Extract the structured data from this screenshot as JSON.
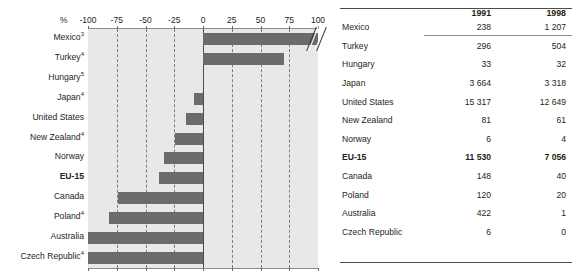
{
  "chart_data": {
    "type": "bar",
    "orientation": "horizontal",
    "title": "",
    "subtitle": "",
    "xlabel": "%",
    "ylabel": "",
    "xlim": [
      -100,
      100
    ],
    "xticks": [
      -100,
      -75,
      -50,
      -25,
      0,
      25,
      50,
      75,
      100
    ],
    "xtick_labels": [
      "-100",
      "-75",
      "-50",
      "-25",
      "0",
      "25",
      "50",
      "75",
      "100"
    ],
    "grid": true,
    "grid_style": "dashed-vertical",
    "legend": "none",
    "axis_break": {
      "present": true,
      "category": "Mexico",
      "note": "double-slash break near the 100% end of the Mexico bar"
    },
    "categories": [
      "Mexico³",
      "Turkey⁴",
      "Hungary⁵",
      "Japan⁴",
      "United States",
      "New Zealand⁴",
      "Norway",
      "EU-15",
      "Canada",
      "Poland⁴",
      "Australia",
      "Czech Republic⁴"
    ],
    "values": [
      100,
      70,
      0,
      -8,
      -15,
      -24,
      -34,
      -38,
      -74,
      -82,
      -100,
      -100
    ],
    "series": [
      {
        "name": "Percentage change 1991-1998",
        "values": [
          100,
          70,
          0,
          -8,
          -15,
          -24,
          -34,
          -38,
          -74,
          -82,
          -100,
          -100
        ]
      }
    ],
    "bar_color": "#6b6b6b",
    "plot_background": "#e8e8e8"
  },
  "chart": {
    "axis_unit_label": "%",
    "rows": [
      {
        "label": "Mexico",
        "sup": "3",
        "bold": false,
        "value": 100,
        "truncated": true
      },
      {
        "label": "Turkey",
        "sup": "4",
        "bold": false,
        "value": 70,
        "truncated": false
      },
      {
        "label": "Hungary",
        "sup": "5",
        "bold": false,
        "value": 0,
        "truncated": false
      },
      {
        "label": "Japan",
        "sup": "4",
        "bold": false,
        "value": -8,
        "truncated": false
      },
      {
        "label": "United States",
        "sup": "",
        "bold": false,
        "value": -15,
        "truncated": false
      },
      {
        "label": "New Zealand",
        "sup": "4",
        "bold": false,
        "value": -24,
        "truncated": false
      },
      {
        "label": "Norway",
        "sup": "",
        "bold": false,
        "value": -34,
        "truncated": false
      },
      {
        "label": "EU-15",
        "sup": "",
        "bold": true,
        "value": -38,
        "truncated": false
      },
      {
        "label": "Canada",
        "sup": "",
        "bold": false,
        "value": -74,
        "truncated": false
      },
      {
        "label": "Poland",
        "sup": "4",
        "bold": false,
        "value": -82,
        "truncated": false
      },
      {
        "label": "Australia",
        "sup": "",
        "bold": false,
        "value": -100,
        "truncated": false
      },
      {
        "label": "Czech Republic",
        "sup": "4",
        "bold": false,
        "value": -100,
        "truncated": false
      }
    ]
  },
  "table": {
    "headers": [
      "",
      "1991",
      "1998"
    ],
    "year_1991": "1991",
    "year_1998": "1998",
    "rows": [
      {
        "name": "Mexico",
        "v1991": "238",
        "v1998": "1 207",
        "bold": false
      },
      {
        "name": "Turkey",
        "v1991": "296",
        "v1998": "504",
        "bold": false
      },
      {
        "name": "Hungary",
        "v1991": "33",
        "v1998": "32",
        "bold": false
      },
      {
        "name": "Japan",
        "v1991": "3 664",
        "v1998": "3 318",
        "bold": false
      },
      {
        "name": "United States",
        "v1991": "15 317",
        "v1998": "12 649",
        "bold": false
      },
      {
        "name": "New Zealand",
        "v1991": "81",
        "v1998": "61",
        "bold": false
      },
      {
        "name": "Norway",
        "v1991": "6",
        "v1998": "4",
        "bold": false
      },
      {
        "name": "EU-15",
        "v1991": "11 530",
        "v1998": "7 056",
        "bold": true
      },
      {
        "name": "Canada",
        "v1991": "148",
        "v1998": "40",
        "bold": false
      },
      {
        "name": "Poland",
        "v1991": "120",
        "v1998": "20",
        "bold": false
      },
      {
        "name": "Australia",
        "v1991": "422",
        "v1998": "1",
        "bold": false
      },
      {
        "name": "Czech Republic",
        "v1991": "6",
        "v1998": "0",
        "bold": false
      }
    ]
  },
  "colors": {
    "bar": "#6b6b6b",
    "plot_bg": "#e8e8e8",
    "text": "#231f20",
    "grid": "#7d7d7d",
    "rule": "#4d4d4d"
  }
}
